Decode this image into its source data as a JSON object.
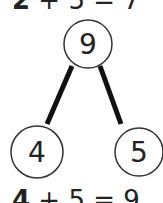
{
  "equations": {
    "top": {
      "first": "2",
      "rest": " + 5 = 7"
    },
    "bottom": {
      "first": "4",
      "rest": " + 5 = 9"
    }
  },
  "number_bond": {
    "whole": "9",
    "parts": [
      "4",
      "5"
    ],
    "line_color": "#111111",
    "circle_stroke": "#333333"
  }
}
